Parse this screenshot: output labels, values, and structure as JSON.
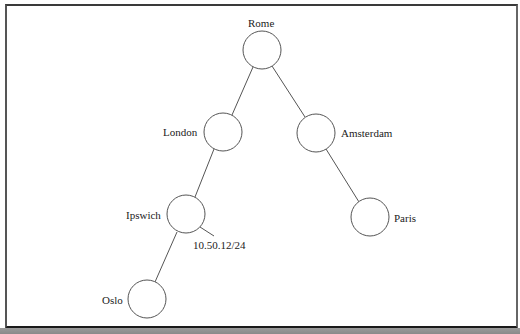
{
  "diagram": {
    "type": "network-tree",
    "nodes": [
      {
        "id": "rome",
        "label": "Rome",
        "cx": 262,
        "cy": 50,
        "r": 19,
        "label_x": 248,
        "label_y": 17
      },
      {
        "id": "london",
        "label": "London",
        "cx": 223,
        "cy": 132,
        "r": 19,
        "label_x": 163,
        "label_y": 126
      },
      {
        "id": "amsterdam",
        "label": "Amsterdam",
        "cx": 316,
        "cy": 133,
        "r": 19,
        "label_x": 341,
        "label_y": 127
      },
      {
        "id": "ipswich",
        "label": "Ipswich",
        "cx": 186,
        "cy": 214,
        "r": 19,
        "label_x": 126,
        "label_y": 209
      },
      {
        "id": "paris",
        "label": "Paris",
        "cx": 370,
        "cy": 217,
        "r": 19,
        "label_x": 394,
        "label_y": 212
      },
      {
        "id": "oslo",
        "label": "Oslo",
        "cx": 147,
        "cy": 299,
        "r": 19,
        "label_x": 102,
        "label_y": 294
      }
    ],
    "edges": [
      {
        "from": "rome",
        "to": "london",
        "x1": 253,
        "y1": 67,
        "x2": 232,
        "y2": 115
      },
      {
        "from": "rome",
        "to": "amsterdam",
        "x1": 272,
        "y1": 66,
        "x2": 305,
        "y2": 117
      },
      {
        "from": "london",
        "to": "ipswich",
        "x1": 214,
        "y1": 149,
        "x2": 195,
        "y2": 197
      },
      {
        "from": "amsterdam",
        "to": "paris",
        "x1": 326,
        "y1": 149,
        "x2": 359,
        "y2": 202
      },
      {
        "from": "ipswich",
        "to": "oslo",
        "x1": 177,
        "y1": 232,
        "x2": 155,
        "y2": 282
      }
    ],
    "annotations": [
      {
        "id": "ipswich-subnet",
        "text": "10.50.12/24",
        "x": 193,
        "y": 239,
        "stub": {
          "x1": 200,
          "y1": 227,
          "x2": 214,
          "y2": 236
        }
      }
    ],
    "colors": {
      "stroke": "#555555",
      "frame": "#333333",
      "background": "#ffffff",
      "bottom_strip": "#8f8f8f"
    }
  }
}
